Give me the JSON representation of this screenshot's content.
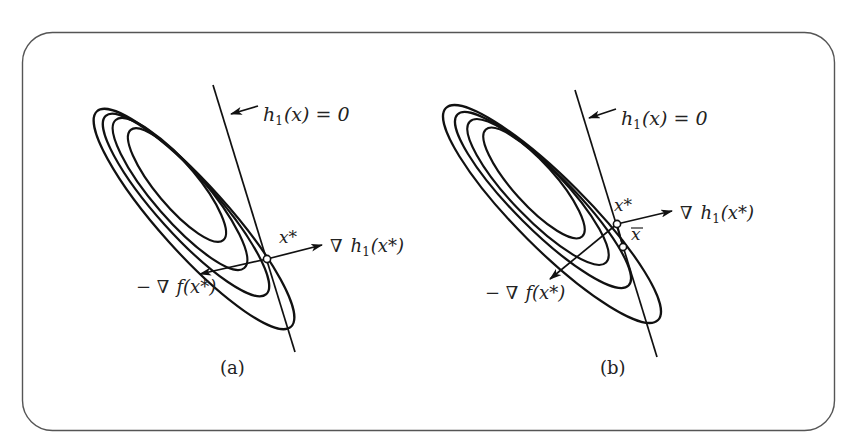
{
  "figure": {
    "panels": [
      {
        "id": "a",
        "caption": "(a)",
        "constraint_label": {
          "func": "h",
          "sub": "1",
          "rest": "(x) = 0"
        },
        "optimum_label": "x*",
        "grad_h_label": {
          "nabla": "∇",
          "func": "h",
          "sub": "1",
          "arg": "(x*)"
        },
        "neg_grad_f_label": {
          "prefix": "− ∇",
          "func": "f",
          "arg": "(x*)"
        },
        "has_x_bar": false
      },
      {
        "id": "b",
        "caption": "(b)",
        "constraint_label": {
          "func": "h",
          "sub": "1",
          "rest": "(x) = 0"
        },
        "optimum_label": "x*",
        "x_bar_label": "x",
        "grad_h_label": {
          "nabla": "∇",
          "func": "h",
          "sub": "1",
          "arg": "(x*)"
        },
        "neg_grad_f_label": {
          "prefix": "− ∇",
          "func": "f",
          "arg": "(x*)"
        },
        "has_x_bar": true
      }
    ],
    "contour_levels": 4
  }
}
